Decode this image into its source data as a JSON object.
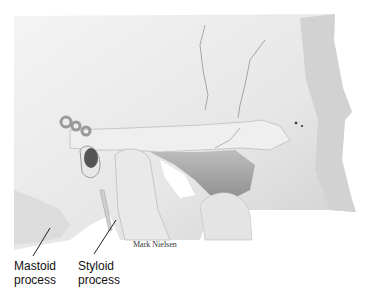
{
  "figure": {
    "labels": [
      {
        "id": "mastoid",
        "text": "Mastoid\nprocess"
      },
      {
        "id": "styloid",
        "text": "Styloid\nprocess"
      }
    ],
    "credit": "Mark Nielsen"
  }
}
